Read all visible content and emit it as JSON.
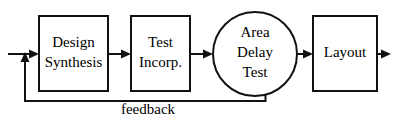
{
  "diagram": {
    "type": "block-flow-diagram",
    "background_color": "#ffffff",
    "line_color": "#111111",
    "text_color": "#000000",
    "nodes": [
      {
        "id": "design-synthesis",
        "shape": "rectangle",
        "line1": "Design",
        "line2": "Synthesis"
      },
      {
        "id": "test-incorp",
        "shape": "rectangle",
        "line1": "Test",
        "line2": "Incorp."
      },
      {
        "id": "area-delay-test",
        "shape": "circle",
        "line1": "Area",
        "line2": "Delay",
        "line3": "Test"
      },
      {
        "id": "layout",
        "shape": "rectangle",
        "line1": "Layout"
      }
    ],
    "edges": [
      {
        "id": "input-edge",
        "label": ""
      },
      {
        "id": "synthesis-to-test",
        "label": ""
      },
      {
        "id": "test-to-area",
        "label": ""
      },
      {
        "id": "area-to-layout",
        "label": ""
      },
      {
        "id": "layout-output",
        "label": ""
      },
      {
        "id": "feedback-edge",
        "label": "feedback"
      }
    ]
  }
}
